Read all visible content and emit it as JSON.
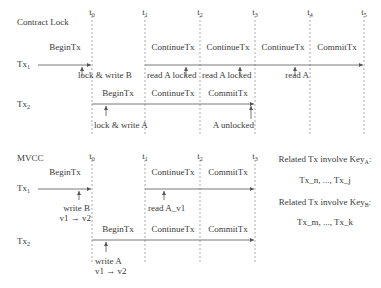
{
  "contract_lock": {
    "title": "Contract Lock",
    "time_marks": [
      {
        "label": "t",
        "sub": "0"
      },
      {
        "label": "t",
        "sub": "1"
      },
      {
        "label": "t",
        "sub": "2"
      },
      {
        "label": "t",
        "sub": "3"
      },
      {
        "label": "t",
        "sub": "4"
      },
      {
        "label": "t",
        "sub": "5"
      }
    ],
    "tx1": {
      "label": "Tx",
      "sub": "1",
      "phases": [
        "BeginTx",
        "ContinueTx",
        "ContinueTx",
        "ContinueTx",
        "CommitTx"
      ],
      "events": [
        "lock & write B",
        "read A locked",
        "read A locked",
        "read A"
      ]
    },
    "tx2": {
      "label": "Tx",
      "sub": "2",
      "phases": [
        "BeginTx",
        "ContinueTx",
        "CommitTx"
      ],
      "events": [
        "lock & write A",
        "A unlocked"
      ]
    }
  },
  "mvcc": {
    "title": "MVCC",
    "time_marks": [
      {
        "label": "t",
        "sub": "0"
      },
      {
        "label": "t",
        "sub": "1"
      },
      {
        "label": "t",
        "sub": "2"
      },
      {
        "label": "t",
        "sub": "3"
      }
    ],
    "tx1": {
      "label": "Tx",
      "sub": "1",
      "phases": [
        "BeginTx",
        "ContinueTx",
        "CommitTx"
      ],
      "events": [
        "write B",
        "v1 → v2",
        "read A_v1"
      ]
    },
    "tx2": {
      "label": "Tx",
      "sub": "2",
      "phases": [
        "BeginTx",
        "ContinueTx",
        "CommitTx"
      ],
      "events": [
        "write A",
        "v1 → v2"
      ]
    },
    "related": {
      "key_a_label": "Related Tx involve Key",
      "key_a_sub": "A",
      "key_a_txs": "Tx_n, ..., Tx_j",
      "key_b_label": "Related Tx involve Key",
      "key_b_sub": "B",
      "key_b_txs": "Tx_m, ..., Tx_k"
    }
  }
}
